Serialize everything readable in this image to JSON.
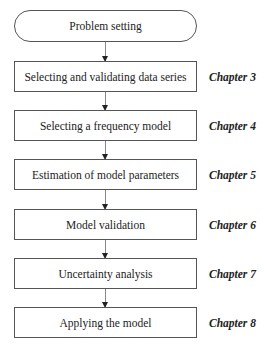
{
  "diagram": {
    "type": "flowchart",
    "start": {
      "label": "Problem setting"
    },
    "steps": [
      {
        "label": "Selecting and validating data series",
        "chapter": "Chapter 3"
      },
      {
        "label": "Selecting a frequency model",
        "chapter": "Chapter 4"
      },
      {
        "label": "Estimation of model parameters",
        "chapter": "Chapter 5"
      },
      {
        "label": "Model validation",
        "chapter": "Chapter 6"
      },
      {
        "label": "Uncertainty analysis",
        "chapter": "Chapter 7"
      },
      {
        "label": "Applying the model",
        "chapter": "Chapter 8"
      }
    ]
  }
}
